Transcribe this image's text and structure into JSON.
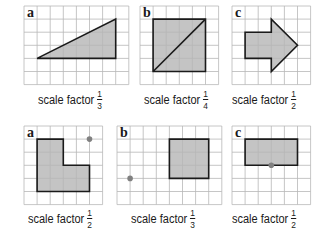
{
  "colors": {
    "grid": "#b8b8b8",
    "shape_fill": "#c4c4c4",
    "shape_stroke": "#1a1a1a",
    "dot": "#808080",
    "label": "#1a1a1a"
  },
  "panels": [
    {
      "id": "top-a",
      "letter": "a",
      "x": 24,
      "y": 6,
      "cols": 8,
      "rows": 6,
      "cell": 13.1,
      "shape": [
        [
          1,
          4
        ],
        [
          7,
          1
        ],
        [
          7,
          4
        ]
      ],
      "diagonal": null,
      "dot": null,
      "caption": {
        "text": "scale factor",
        "num": "1",
        "den": "3",
        "x": 38,
        "y": 89
      }
    },
    {
      "id": "top-b",
      "letter": "b",
      "x": 140,
      "y": 6,
      "cols": 6,
      "rows": 6,
      "cell": 13.1,
      "shape": [
        [
          1,
          1
        ],
        [
          5,
          1
        ],
        [
          5,
          5
        ],
        [
          1,
          5
        ]
      ],
      "diagonal": [
        [
          1,
          5
        ],
        [
          5,
          1
        ]
      ],
      "dot": null,
      "caption": {
        "text": "scale factor",
        "num": "1",
        "den": "4",
        "x": 144,
        "y": 89
      }
    },
    {
      "id": "top-c",
      "letter": "c",
      "x": 232,
      "y": 6,
      "cols": 6,
      "rows": 6,
      "cell": 13.1,
      "shape": [
        [
          1,
          2
        ],
        [
          3,
          2
        ],
        [
          3,
          1
        ],
        [
          5,
          3
        ],
        [
          3,
          5
        ],
        [
          3,
          4
        ],
        [
          1,
          4
        ]
      ],
      "diagonal": null,
      "dot": null,
      "caption": {
        "text": "scale factor",
        "num": "1",
        "den": "2",
        "x": 232,
        "y": 89
      }
    },
    {
      "id": "bottom-a",
      "letter": "a",
      "x": 24,
      "y": 126,
      "cols": 6,
      "rows": 6,
      "cell": 13.1,
      "shape": [
        [
          1,
          1
        ],
        [
          3,
          1
        ],
        [
          3,
          3
        ],
        [
          5,
          3
        ],
        [
          5,
          5
        ],
        [
          1,
          5
        ]
      ],
      "diagonal": null,
      "dot": [
        5,
        1
      ],
      "caption": {
        "text": "scale factor",
        "num": "1",
        "den": "2",
        "x": 28,
        "y": 208
      }
    },
    {
      "id": "bottom-b",
      "letter": "b",
      "x": 117,
      "y": 126,
      "cols": 8,
      "rows": 6,
      "cell": 13.1,
      "shape": [
        [
          4,
          1
        ],
        [
          7,
          1
        ],
        [
          7,
          4
        ],
        [
          4,
          4
        ]
      ],
      "diagonal": null,
      "dot": [
        1,
        4
      ],
      "caption": {
        "text": "scale factor",
        "num": "1",
        "den": "3",
        "x": 131,
        "y": 208
      }
    },
    {
      "id": "bottom-c",
      "letter": "c",
      "x": 232,
      "y": 126,
      "cols": 6,
      "rows": 6,
      "cell": 13.1,
      "shape": [
        [
          1,
          1
        ],
        [
          5,
          1
        ],
        [
          5,
          3
        ],
        [
          1,
          3
        ]
      ],
      "diagonal": null,
      "dot": [
        3,
        3
      ],
      "caption": {
        "text": "scale factor",
        "num": "1",
        "den": "2",
        "x": 232,
        "y": 208
      }
    }
  ]
}
